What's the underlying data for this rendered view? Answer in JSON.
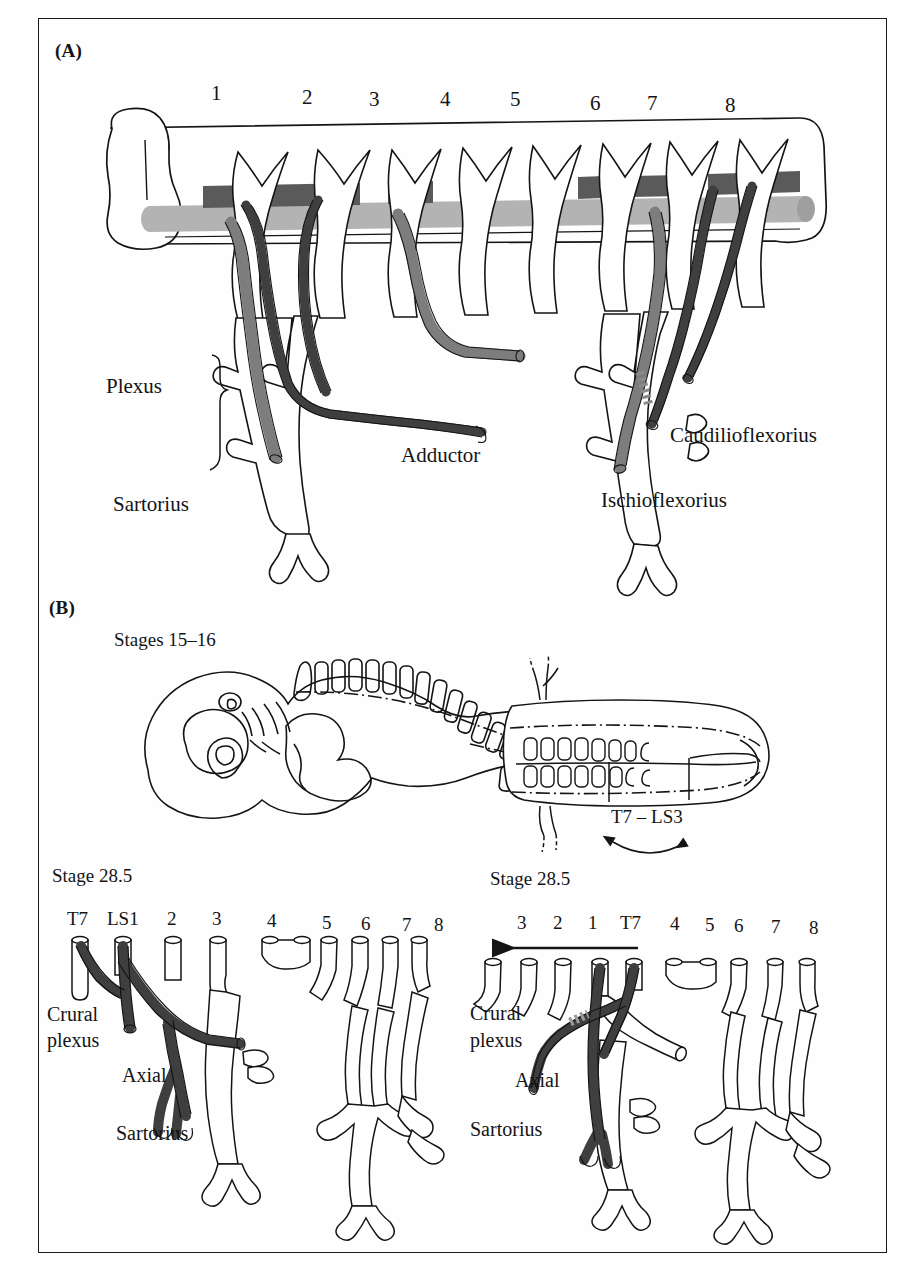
{
  "figure": {
    "panels": [
      {
        "letter": "(A)"
      },
      {
        "letter": "(B)"
      }
    ]
  },
  "panel_a": {
    "letter": "(A)",
    "segment_numbers": [
      "1",
      "2",
      "3",
      "4",
      "5",
      "6",
      "7",
      "8"
    ],
    "labels": {
      "plexus": "Plexus",
      "sartorius": "Sartorius",
      "adductor": "Adductor",
      "caudilioflexorius": "Caudilioflexorius",
      "ischioflexorius": "Ischioflexorius"
    },
    "colors": {
      "dark_nerve": "#3f3f3f",
      "mid_nerve": "#7d7d7d",
      "light_nerve": "#b3b3b3",
      "outline": "#141414"
    }
  },
  "panel_b": {
    "letter": "(B)",
    "embryo": {
      "stage_label": "Stages 15–16",
      "segment_range_label": "T7 – LS3"
    },
    "left_plexus": {
      "stage_label": "Stage 28.5",
      "roots": [
        "T7",
        "LS1",
        "2",
        "3",
        "4",
        "5",
        "6",
        "7",
        "8"
      ],
      "labels": {
        "crural_plexus_line1": "Crural",
        "crural_plexus_line2": "plexus",
        "axial": "Axial",
        "sartorius": "Sartorius"
      }
    },
    "right_plexus": {
      "stage_label": "Stage 28.5",
      "roots": [
        "3",
        "2",
        "1",
        "T7",
        "4",
        "5",
        "6",
        "7",
        "8"
      ],
      "arrow_direction": "left",
      "labels": {
        "crural_plexus_line1": "Crural",
        "crural_plexus_line2": "plexus",
        "axial": "Axial",
        "sartorius": "Sartorius"
      }
    }
  }
}
